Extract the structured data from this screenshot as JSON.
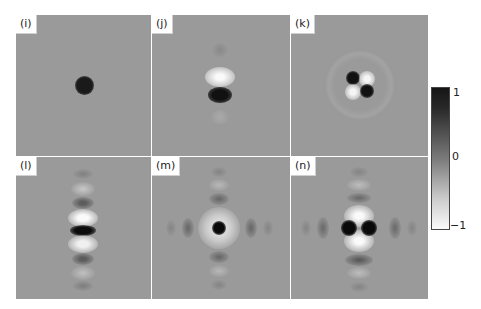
{
  "figure": {
    "panels": [
      {
        "label": "(i)",
        "pattern": "single dark spot at center"
      },
      {
        "label": "(j)",
        "pattern": "bright lobe above, dark lobe below center, faint vertical side lobes"
      },
      {
        "label": "(k)",
        "pattern": "four-lobed quadrupole: dark upper-left and lower-right, bright upper-right and lower-left"
      },
      {
        "label": "(l)",
        "pattern": "dark center with alternating bright/dark fringes along vertical axis"
      },
      {
        "label": "(m)",
        "pattern": "dark center spot with bright ring and alternating fringes along both axes"
      },
      {
        "label": "(n)",
        "pattern": "two dark spots horizontally, bright lobes above and below, fringes along both axes"
      }
    ],
    "colorbar": {
      "ticks": [
        "1",
        "0",
        "−1"
      ],
      "max": 1,
      "min": -1,
      "colors": {
        "max": "#151515",
        "mid": "#7a7a7a",
        "min": "#fafafa"
      }
    }
  }
}
